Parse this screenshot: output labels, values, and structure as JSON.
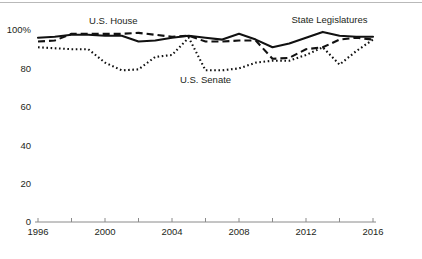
{
  "chart_data": {
    "type": "line",
    "title": "",
    "subtitle": "",
    "xlabel": "",
    "ylabel": "",
    "xlim": [
      1996,
      2016
    ],
    "ylim": [
      0,
      100
    ],
    "grid": false,
    "legend_position": "inline-annotations",
    "y_ticks": [
      0,
      20,
      40,
      60,
      80,
      100
    ],
    "y_tick_labels": [
      "0",
      "20",
      "40",
      "60",
      "80",
      "100%"
    ],
    "x_ticks": [
      1996,
      1998,
      2000,
      2002,
      2004,
      2006,
      2008,
      2010,
      2012,
      2014,
      2016
    ],
    "x_tick_labels": [
      "1996",
      "",
      "2000",
      "",
      "2004",
      "",
      "2008",
      "",
      "2012",
      "",
      "2016"
    ],
    "x_labeled_ticks": [
      1996,
      2000,
      2004,
      2008,
      2012,
      2016
    ],
    "x": [
      1996,
      1997,
      1998,
      1999,
      2000,
      2001,
      2002,
      2003,
      2004,
      2005,
      2006,
      2007,
      2008,
      2009,
      2010,
      2011,
      2012,
      2013,
      2014,
      2015,
      2016
    ],
    "series": [
      {
        "name": "State Legislatures",
        "style": "solid",
        "color": "#111111",
        "values": [
          96,
          96.5,
          97.5,
          97.5,
          97,
          97,
          94,
          94.5,
          96,
          97,
          96,
          95,
          98,
          95,
          91,
          93,
          96,
          99,
          97,
          96.5,
          96.5
        ],
        "label_text": "State Legislatures"
      },
      {
        "name": "U.S. House",
        "style": "dashed",
        "color": "#111111",
        "values": [
          94,
          94.5,
          98,
          98,
          98,
          98,
          98.5,
          97.5,
          96.5,
          97,
          94,
          94,
          94.5,
          94.5,
          85,
          85.5,
          90,
          91,
          95,
          96,
          95
        ],
        "label_text": "U.S. House"
      },
      {
        "name": "U.S. Senate",
        "style": "dotted",
        "color": "#111111",
        "values": [
          91,
          90.5,
          90,
          90,
          83,
          79,
          79.5,
          86,
          87,
          96,
          79,
          79,
          80,
          83,
          84,
          84,
          87,
          91,
          82,
          89,
          95
        ],
        "label_text": "U.S. Senate"
      }
    ],
    "annotations": [
      {
        "text": "U.S. House",
        "x": 2000.5,
        "y_px": 24
      },
      {
        "text": "U.S. Senate",
        "x": 2006.0,
        "y_px": 83
      },
      {
        "text": "State Legislatures",
        "x": 2013.4,
        "y_px": 23
      }
    ]
  }
}
